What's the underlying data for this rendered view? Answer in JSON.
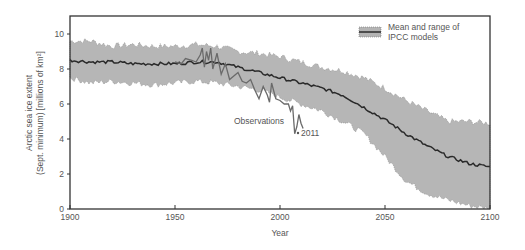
{
  "chart_data": {
    "type": "line",
    "title": "",
    "xlabel": "Year",
    "ylabel": "Arctic sea ice extent (Sept. minimum) [millions of km²]",
    "ylabel_line1": "Arctic sea ice extent",
    "ylabel_line2": "(Sept. minimum) [millions of km²]",
    "xlim": [
      1900,
      2100
    ],
    "ylim": [
      0,
      11
    ],
    "x_ticks": [
      1900,
      1950,
      2000,
      2050,
      2100
    ],
    "y_ticks": [
      0,
      2,
      4,
      6,
      8,
      10
    ],
    "grid": false,
    "legend": {
      "position": "upper right",
      "entries": [
        "Mean and range of IPCC models"
      ],
      "line1": "Mean and range of",
      "line2": "IPCC models"
    },
    "annotations": [
      {
        "text": "Observations",
        "x": 1985,
        "y": 4.9
      },
      {
        "text": "2011",
        "x": 2011,
        "y": 4.3
      }
    ],
    "series": [
      {
        "name": "IPCC models mean",
        "x": [
          1900,
          1910,
          1920,
          1930,
          1940,
          1950,
          1960,
          1970,
          1980,
          1990,
          2000,
          2010,
          2020,
          2030,
          2040,
          2050,
          2060,
          2070,
          2080,
          2090,
          2100
        ],
        "values": [
          8.5,
          8.4,
          8.4,
          8.3,
          8.3,
          8.3,
          8.4,
          8.4,
          8.1,
          7.8,
          7.5,
          7.2,
          6.9,
          6.5,
          5.8,
          5.1,
          4.3,
          3.6,
          3.0,
          2.6,
          2.4
        ]
      },
      {
        "name": "IPCC models range (upper)",
        "x": [
          1900,
          1910,
          1920,
          1930,
          1940,
          1950,
          1960,
          1970,
          1980,
          1990,
          2000,
          2010,
          2020,
          2030,
          2040,
          2050,
          2060,
          2070,
          2080,
          2090,
          2100
        ],
        "values": [
          9.6,
          9.6,
          9.3,
          9.4,
          9.3,
          9.3,
          9.4,
          9.3,
          9.0,
          8.9,
          8.7,
          8.4,
          8.1,
          7.9,
          7.5,
          6.9,
          6.2,
          5.6,
          5.0,
          5.0,
          4.9
        ]
      },
      {
        "name": "IPCC models range (lower)",
        "x": [
          1900,
          1910,
          1920,
          1930,
          1940,
          1950,
          1960,
          1970,
          1980,
          1990,
          2000,
          2010,
          2020,
          2030,
          2040,
          2050,
          2060,
          2070,
          2080,
          2090,
          2100
        ],
        "values": [
          7.5,
          7.2,
          7.3,
          7.2,
          7.1,
          7.2,
          7.3,
          7.2,
          7.0,
          6.8,
          6.4,
          6.0,
          5.6,
          5.0,
          4.3,
          3.0,
          1.6,
          0.9,
          0.5,
          0.2,
          0.0
        ]
      },
      {
        "name": "Observations",
        "x": [
          1950,
          1953,
          1955,
          1958,
          1960,
          1962,
          1963,
          1964,
          1965,
          1966,
          1967,
          1968,
          1970,
          1972,
          1974,
          1976,
          1978,
          1980,
          1982,
          1984,
          1986,
          1988,
          1990,
          1992,
          1994,
          1995,
          1996,
          1998,
          2000,
          2002,
          2004,
          2005,
          2006,
          2007,
          2008,
          2009,
          2010,
          2011
        ],
        "values": [
          8.4,
          8.3,
          8.6,
          8.5,
          8.4,
          8.8,
          9.2,
          8.1,
          9.0,
          8.5,
          9.2,
          8.0,
          8.9,
          7.7,
          8.3,
          7.4,
          7.6,
          7.8,
          7.3,
          7.2,
          7.4,
          6.8,
          6.3,
          7.0,
          6.5,
          6.1,
          7.2,
          6.3,
          6.2,
          6.0,
          6.0,
          5.6,
          5.9,
          4.3,
          4.7,
          5.4,
          4.9,
          4.6
        ]
      }
    ]
  }
}
